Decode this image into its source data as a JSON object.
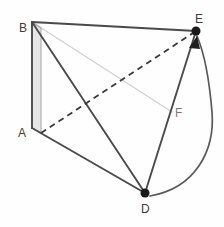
{
  "figure": {
    "background_color": "#fefefe",
    "width": 224,
    "height": 227,
    "colors": {
      "edge_dark": "#4a4a4a",
      "edge_light": "#cfcfcf",
      "dashed": "#3a3a3a",
      "shade_fill": "#e6e6e6",
      "vertex_dot": "#1a1a1a",
      "label_dark": "#3c3c3c",
      "label_gray": "#7a7a7a",
      "arc": "#5a5a5a"
    }
  },
  "labels": {
    "A": "A",
    "B": "B",
    "D": "D",
    "E": "E",
    "F": "F"
  },
  "vertices": {
    "A": {
      "x": 32,
      "y": 128
    },
    "B": {
      "x": 32,
      "y": 22
    },
    "D": {
      "x": 145,
      "y": 193
    },
    "E": {
      "x": 196,
      "y": 31
    },
    "A_back": {
      "x": 41,
      "y": 133
    },
    "B_back": {
      "x": 41,
      "y": 28
    },
    "F_point": {
      "x": 172,
      "y": 112
    }
  },
  "marked_points": [
    {
      "id": "D",
      "x": 145,
      "y": 193,
      "radius": 4.5
    },
    {
      "id": "E",
      "x": 196,
      "y": 31,
      "radius": 4.5
    }
  ],
  "edges": [
    {
      "id": "B-E",
      "from": "B",
      "to": "E",
      "style": "solid",
      "weight": "heavy"
    },
    {
      "id": "B-A",
      "from": "B",
      "to": "A",
      "style": "solid",
      "weight": "heavy"
    },
    {
      "id": "B-D",
      "from": "B",
      "to": "D",
      "style": "solid",
      "weight": "heavy"
    },
    {
      "id": "A-D",
      "from": "A",
      "to": "D",
      "style": "solid",
      "weight": "heavy"
    },
    {
      "id": "E-D",
      "from": "E",
      "to": "D",
      "style": "solid",
      "weight": "heavy"
    },
    {
      "id": "B_back-A_back",
      "from": "B_back",
      "to": "A_back",
      "style": "solid",
      "weight": "light"
    },
    {
      "id": "B-B_back",
      "from": "B",
      "to": "B_back",
      "style": "solid",
      "weight": "light"
    },
    {
      "id": "A-A_back",
      "from": "A",
      "to": "A_back",
      "style": "solid",
      "weight": "light"
    },
    {
      "id": "B-F_point",
      "from": "B",
      "to": "F_point",
      "style": "solid",
      "weight": "faint"
    },
    {
      "id": "A_back-E",
      "from": "A_back",
      "to": "E",
      "style": "dashed",
      "weight": "medium"
    }
  ],
  "shaded_face": {
    "id": "face-ABba",
    "points": "32,22 41,28 41,133 32,128",
    "fill": "#e6e6e6"
  },
  "arc": {
    "id": "rotation-arc",
    "from": "D",
    "to": "E",
    "path": "M 150 196 C 196 188 215 150 212 112 C 209 76 203 50 197 36",
    "has_arrowhead": true,
    "arrowhead_at": "E"
  }
}
